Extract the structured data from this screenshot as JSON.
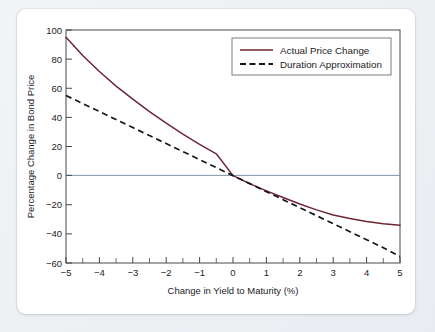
{
  "figure": {
    "background_color": "#ffffff",
    "page_background_color": "#eef1f4"
  },
  "legend": {
    "position": "top-right",
    "entries": [
      {
        "label": "Actual Price Change",
        "style": "solid",
        "color": "#6e2634"
      },
      {
        "label": "Duration Approximation",
        "style": "dashed",
        "color": "#15161a"
      }
    ]
  },
  "chart_data": {
    "type": "line",
    "title": "",
    "xlabel": "Change in Yield to Maturity (%)",
    "ylabel": "Percentage Change in Bond Price",
    "xlim": [
      -5,
      5
    ],
    "ylim": [
      -60,
      100
    ],
    "xticks": [
      -5,
      -4,
      -3,
      -2,
      -1,
      0,
      1,
      2,
      3,
      4,
      5
    ],
    "xticklabels": [
      "−5",
      "−4",
      "−3",
      "−2",
      "−1",
      "0",
      "1",
      "2",
      "3",
      "4",
      "5"
    ],
    "yticks": [
      -60,
      -40,
      -20,
      0,
      20,
      40,
      60,
      80,
      100
    ],
    "yticklabels": [
      "−60",
      "−40",
      "−20",
      "0",
      "20",
      "40",
      "60",
      "80",
      "100"
    ],
    "minor_xtick_interval": 0.5,
    "grid": false,
    "zero_reference_line": {
      "y": 0,
      "color": "#7d93ac"
    },
    "x": [
      -5,
      -4.5,
      -4,
      -3.5,
      -3,
      -2.5,
      -2,
      -1.5,
      -1,
      -0.5,
      0,
      0.5,
      1,
      1.5,
      2,
      2.5,
      3,
      3.5,
      4,
      4.5,
      5
    ],
    "series": [
      {
        "name": "Actual Price Change",
        "style": "solid",
        "color": "#6e2634",
        "values": [
          95,
          82.5,
          71.5,
          61.5,
          52.5,
          44,
          36,
          28.5,
          21.5,
          15,
          0,
          -5.5,
          -10.5,
          -15,
          -19.5,
          -23.5,
          -27,
          -29.5,
          -31.5,
          -33,
          -34
        ]
      },
      {
        "name": "Duration Approximation",
        "style": "dashed",
        "color": "#15161a",
        "values": [
          55,
          49.5,
          44,
          38.5,
          33,
          27.5,
          22,
          16.5,
          11,
          5.5,
          0,
          -5.5,
          -11,
          -16.5,
          -22,
          -27.5,
          -33,
          -38.5,
          -44,
          -49.5,
          -55.5
        ]
      }
    ]
  }
}
